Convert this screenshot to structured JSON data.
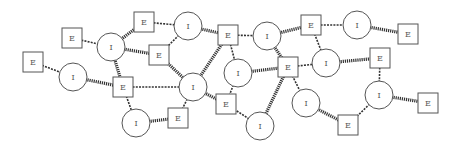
{
  "diagram": {
    "type": "bipartite-network",
    "node_types": {
      "E": {
        "shape": "square",
        "label": "E"
      },
      "I": {
        "shape": "circle",
        "label": "I"
      }
    },
    "nodes": [
      {
        "id": "E1",
        "type": "E",
        "label": "E",
        "x": 33,
        "y": 62
      },
      {
        "id": "I1",
        "type": "I",
        "label": "I",
        "x": 73,
        "y": 77
      },
      {
        "id": "E2",
        "type": "E",
        "label": "E",
        "x": 72,
        "y": 38
      },
      {
        "id": "I2",
        "type": "I",
        "label": "I",
        "x": 111,
        "y": 47
      },
      {
        "id": "E3",
        "type": "E",
        "label": "E",
        "x": 144,
        "y": 22
      },
      {
        "id": "I3",
        "type": "I",
        "label": "I",
        "x": 188,
        "y": 26
      },
      {
        "id": "E4",
        "type": "E",
        "label": "E",
        "x": 159,
        "y": 55
      },
      {
        "id": "E5",
        "type": "E",
        "label": "E",
        "x": 123,
        "y": 87
      },
      {
        "id": "I4",
        "type": "I",
        "label": "I",
        "x": 193,
        "y": 87
      },
      {
        "id": "I5",
        "type": "I",
        "label": "I",
        "x": 136,
        "y": 123
      },
      {
        "id": "E6",
        "type": "E",
        "label": "E",
        "x": 178,
        "y": 118
      },
      {
        "id": "E7",
        "type": "E",
        "label": "E",
        "x": 228,
        "y": 35
      },
      {
        "id": "I6",
        "type": "I",
        "label": "I",
        "x": 238,
        "y": 73
      },
      {
        "id": "E8",
        "type": "E",
        "label": "E",
        "x": 226,
        "y": 104
      },
      {
        "id": "I7",
        "type": "I",
        "label": "I",
        "x": 267,
        "y": 36
      },
      {
        "id": "E9",
        "type": "E",
        "label": "E",
        "x": 288,
        "y": 67
      },
      {
        "id": "I8",
        "type": "I",
        "label": "I",
        "x": 260,
        "y": 126
      },
      {
        "id": "E10",
        "type": "E",
        "label": "E",
        "x": 311,
        "y": 25
      },
      {
        "id": "I9",
        "type": "I",
        "label": "I",
        "x": 326,
        "y": 63
      },
      {
        "id": "I10",
        "type": "I",
        "label": "I",
        "x": 357,
        "y": 25
      },
      {
        "id": "E11",
        "type": "E",
        "label": "E",
        "x": 408,
        "y": 34
      },
      {
        "id": "E12",
        "type": "E",
        "label": "E",
        "x": 380,
        "y": 58
      },
      {
        "id": "I11",
        "type": "I",
        "label": "I",
        "x": 306,
        "y": 103
      },
      {
        "id": "E13",
        "type": "E",
        "label": "E",
        "x": 348,
        "y": 125
      },
      {
        "id": "I12",
        "type": "I",
        "label": "I",
        "x": 379,
        "y": 95
      },
      {
        "id": "E14",
        "type": "E",
        "label": "E",
        "x": 428,
        "y": 103
      }
    ],
    "edges": [
      {
        "from": "E1",
        "to": "I1",
        "style": "thin"
      },
      {
        "from": "I1",
        "to": "E5",
        "style": "thick"
      },
      {
        "from": "E2",
        "to": "I2",
        "style": "thin"
      },
      {
        "from": "I2",
        "to": "E3",
        "style": "thick"
      },
      {
        "from": "I2",
        "to": "E4",
        "style": "thick"
      },
      {
        "from": "I2",
        "to": "E5",
        "style": "thick"
      },
      {
        "from": "E3",
        "to": "I3",
        "style": "thin"
      },
      {
        "from": "I3",
        "to": "E4",
        "style": "thin"
      },
      {
        "from": "I3",
        "to": "E7",
        "style": "thick"
      },
      {
        "from": "E4",
        "to": "I4",
        "style": "thick"
      },
      {
        "from": "E5",
        "to": "I4",
        "style": "thin"
      },
      {
        "from": "E5",
        "to": "I5",
        "style": "thin"
      },
      {
        "from": "I5",
        "to": "E6",
        "style": "thick"
      },
      {
        "from": "E6",
        "to": "I4",
        "style": "thin"
      },
      {
        "from": "I4",
        "to": "E7",
        "style": "thick"
      },
      {
        "from": "I4",
        "to": "E8",
        "style": "thick"
      },
      {
        "from": "E7",
        "to": "I7",
        "style": "thin"
      },
      {
        "from": "E7",
        "to": "I6",
        "style": "thin"
      },
      {
        "from": "I6",
        "to": "E8",
        "style": "thin"
      },
      {
        "from": "I6",
        "to": "E9",
        "style": "thick"
      },
      {
        "from": "I7",
        "to": "E10",
        "style": "thick"
      },
      {
        "from": "I7",
        "to": "E9",
        "style": "thick"
      },
      {
        "from": "E8",
        "to": "I8",
        "style": "thin"
      },
      {
        "from": "E9",
        "to": "I8",
        "style": "thick"
      },
      {
        "from": "E9",
        "to": "I9",
        "style": "thin"
      },
      {
        "from": "E9",
        "to": "I11",
        "style": "thin"
      },
      {
        "from": "E10",
        "to": "I10",
        "style": "thin"
      },
      {
        "from": "E10",
        "to": "I9",
        "style": "thin"
      },
      {
        "from": "I10",
        "to": "E11",
        "style": "thick"
      },
      {
        "from": "I9",
        "to": "E12",
        "style": "thick"
      },
      {
        "from": "E12",
        "to": "I12",
        "style": "thin"
      },
      {
        "from": "I12",
        "to": "E14",
        "style": "thick"
      },
      {
        "from": "I12",
        "to": "E13",
        "style": "thin"
      },
      {
        "from": "I11",
        "to": "E13",
        "style": "thick"
      }
    ],
    "style": {
      "square_size": 20,
      "circle_radius": 14,
      "stroke_color": "#555555",
      "edge_color": "#333333",
      "background": "#ffffff"
    }
  }
}
